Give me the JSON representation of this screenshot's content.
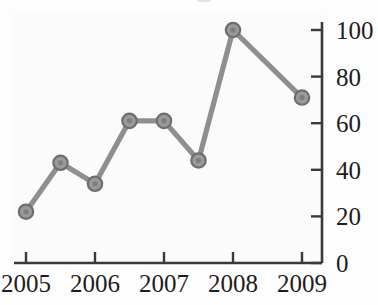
{
  "chart_data": {
    "type": "line",
    "title": "",
    "xlabel": "",
    "ylabel": "",
    "x": [
      2005,
      2005.5,
      2006,
      2006.5,
      2007,
      2007.5,
      2008,
      2009
    ],
    "values": [
      22,
      43,
      34,
      61,
      61,
      44,
      100,
      71
    ],
    "points": [
      {
        "x": 2005,
        "y": 22
      },
      {
        "x": 2005.5,
        "y": 43
      },
      {
        "x": 2006,
        "y": 34
      },
      {
        "x": 2006.5,
        "y": 61
      },
      {
        "x": 2007,
        "y": 61
      },
      {
        "x": 2007.5,
        "y": 44
      },
      {
        "x": 2008,
        "y": 100
      },
      {
        "x": 2009,
        "y": 71
      }
    ],
    "xlim": [
      2004.82,
      2009.25
    ],
    "ylim": [
      0,
      104
    ],
    "x_tick_labels": [
      "2005",
      "2006",
      "2007",
      "2008",
      "2009"
    ],
    "x_tick_values": [
      2005,
      2006,
      2007,
      2008,
      2009
    ],
    "y_tick_labels": [
      "0",
      "20",
      "40",
      "60",
      "80",
      "100"
    ],
    "y_tick_values": [
      0,
      20,
      40,
      60,
      80,
      100
    ],
    "y_axis_position": "right",
    "grid": false,
    "legend": null,
    "marker": "circle",
    "colors": {
      "line": "#8f8f8f",
      "marker_fill": "#9a9a9a",
      "marker_edge": "#6e6e6e",
      "axis": "#3a3a3a",
      "text": "#1d1d1d",
      "background": "#fdfdfd"
    }
  }
}
